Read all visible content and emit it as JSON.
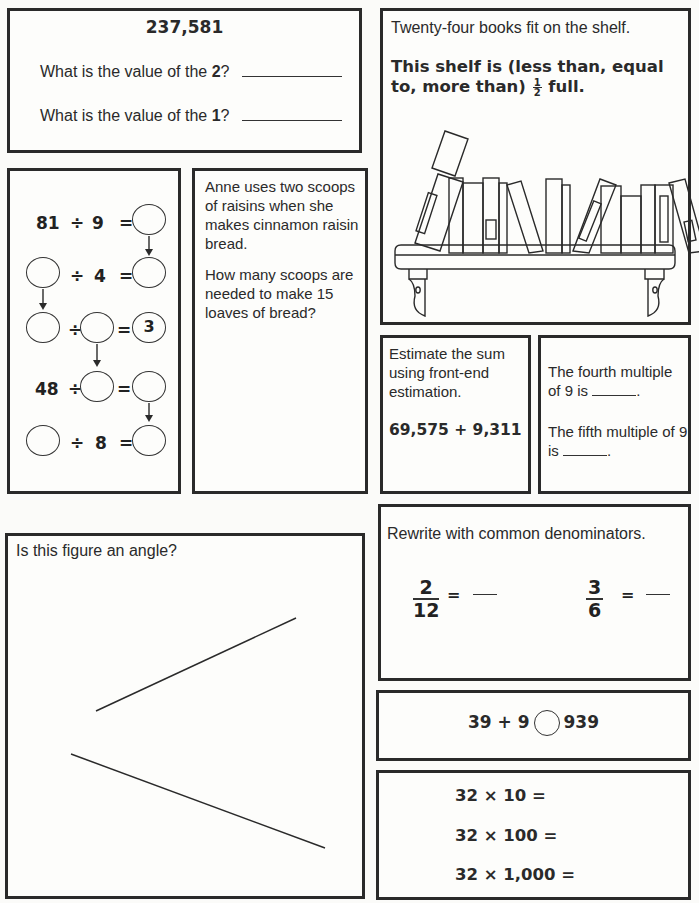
{
  "place_value": {
    "number": "237,581",
    "questions": [
      {
        "prefix": "What is the value of the ",
        "digit": "2",
        "suffix": "?"
      },
      {
        "prefix": "What is the value of the ",
        "digit": "1",
        "suffix": "?"
      }
    ]
  },
  "shelf": {
    "statement": "Twenty-four books fit on the shelf.",
    "question_pre": "This shelf is (less than, equal to, more than) ",
    "fraction_numerator": "1",
    "fraction_denominator": "2",
    "question_post": " full.",
    "illustration": "bookshelf-with-books"
  },
  "division_chain": {
    "rows": [
      {
        "left": "81",
        "op": "÷",
        "middle": "9",
        "eq": "=",
        "result": ""
      },
      {
        "left": "",
        "op": "÷",
        "middle": "4",
        "eq": "=",
        "result": ""
      },
      {
        "left": "",
        "op": "÷",
        "middle": "",
        "eq": "=",
        "result": "3"
      },
      {
        "left": "48",
        "op": "÷",
        "middle": "",
        "eq": "=",
        "result": ""
      },
      {
        "left": "",
        "op": "÷",
        "middle": "8",
        "eq": "=",
        "result": ""
      }
    ]
  },
  "raisins": {
    "paragraph1": "Anne uses two scoops of raisins when she makes cinnamon raisin bread.",
    "paragraph2": "How many scoops are needed to make 15 loaves of bread?"
  },
  "estimate": {
    "instruction": "Estimate the sum using front-end estimation.",
    "expression": "69,575 + 9,311"
  },
  "multiples": {
    "q1_pre": "The fourth multiple of 9 is ",
    "q1_post": ".",
    "q2_pre": "The fifth multiple of 9 is ",
    "q2_post": "."
  },
  "angle": {
    "question": "Is this figure an angle?"
  },
  "denominators": {
    "instruction": "Rewrite with common denominators.",
    "fractions": [
      {
        "numerator": "2",
        "denominator": "12",
        "eq": "="
      },
      {
        "numerator": "3",
        "denominator": "6",
        "eq": "="
      }
    ]
  },
  "compare": {
    "left": "39 + 9",
    "right": "939"
  },
  "multiply": {
    "rows": [
      "32 × 10 =",
      "32 × 100 =",
      "32 × 1,000 ="
    ]
  }
}
